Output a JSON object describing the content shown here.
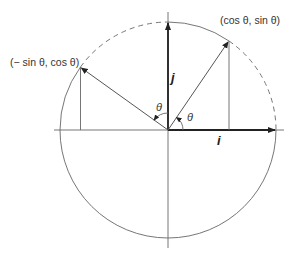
{
  "diagram": {
    "labels": {
      "point_rotated_i": "(cos θ, sin θ)",
      "point_rotated_j": "(− sin θ, cos θ)",
      "axis_i": "i",
      "axis_j": "j",
      "angle_i": "θ",
      "angle_j": "θ"
    },
    "elements": {
      "circle": "unit circle (solid lower half and arc from top to (cos θ, sin θ); dashed arcs from (cos θ, sin θ) to i and from top to (− sin θ, cos θ))",
      "vector_i": "bold arrow along positive x-axis",
      "vector_j": "bold arrow along positive y-axis",
      "rotated_vector_1": "arrow from origin to (cos θ, sin θ)",
      "rotated_vector_2": "arrow from origin to (− sin θ, cos θ)",
      "projection_lines": "vertical drop lines from both rotated points to x-axis",
      "angle_arcs": "two arcs marked θ with arrowheads"
    },
    "colors": {
      "line": "#666666",
      "vector": "#222222",
      "text": "#333333",
      "background": "#ffffff"
    }
  }
}
